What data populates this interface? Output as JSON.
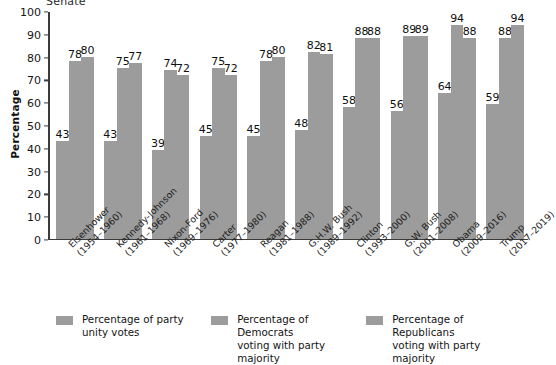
{
  "chart_data": {
    "type": "bar",
    "title": "Senate",
    "xlabel": "",
    "ylabel": "Percentage",
    "ylim": [
      0,
      100
    ],
    "yticks": [
      0,
      10,
      20,
      30,
      40,
      50,
      60,
      70,
      80,
      90,
      100
    ],
    "grid": false,
    "legend_position": "bottom",
    "categories": [
      "Eisenhower (1954–1960)",
      "Kennedy-Johnson (1961–1968)",
      "Nixon-Ford (1969–1976)",
      "Carter (1977–1980)",
      "Reagan (1981–1988)",
      "G.H.W. Bush (1989–1992)",
      "Clinton (1993–2000)",
      "G.W. Bush (2001–2008)",
      "Obama (2009–2016)",
      "Trump (2017–2019)"
    ],
    "category_lines": [
      {
        "name": "Eisenhower",
        "years": "(1954–1960)"
      },
      {
        "name": "Kennedy-Johnson",
        "years": "(1961–1968)"
      },
      {
        "name": "Nixon-Ford",
        "years": "(1969–1976)"
      },
      {
        "name": "Carter",
        "years": "(1977–1980)"
      },
      {
        "name": "Reagan",
        "years": "(1981–1988)"
      },
      {
        "name": "G.H.W. Bush",
        "years": "(1989–1992)"
      },
      {
        "name": "Clinton",
        "years": "(1993–2000)"
      },
      {
        "name": "G.W. Bush",
        "years": "(2001–2008)"
      },
      {
        "name": "Obama",
        "years": "(2009–2016)"
      },
      {
        "name": "Trump",
        "years": "(2017–2019)"
      }
    ],
    "series": [
      {
        "name": "Percentage of party unity votes",
        "legend_line1": "Percentage of party",
        "legend_line2": "unity votes",
        "color": "#9c9c9c",
        "values": [
          43,
          43,
          39,
          45,
          45,
          48,
          58,
          56,
          64,
          59
        ]
      },
      {
        "name": "Percentage of Democrats voting with party majority",
        "legend_line1": "Percentage of Democrats",
        "legend_line2": "voting with party majority",
        "color": "#9c9c9c",
        "values": [
          78,
          75,
          74,
          75,
          78,
          82,
          88,
          89,
          94,
          88
        ]
      },
      {
        "name": "Percentage of Republicans voting with party majority",
        "legend_line1": "Percentage of Republicans",
        "legend_line2": "voting with party majority",
        "color": "#9c9c9c",
        "values": [
          80,
          77,
          72,
          72,
          80,
          81,
          88,
          89,
          88,
          94
        ]
      }
    ]
  }
}
